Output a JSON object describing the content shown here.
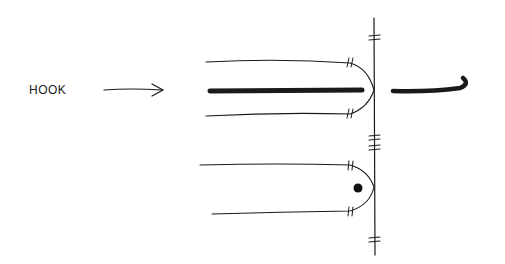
{
  "diagram": {
    "label": "HOOK",
    "colors": {
      "ink": "#1a1a1a",
      "background": "#ffffff"
    },
    "elements": [
      "arrow pointing to hook",
      "upper rounded loop with hook shaft inside",
      "detached hook glyph to the right",
      "lower rounded loop with dot",
      "vertical line with tick marks"
    ]
  }
}
